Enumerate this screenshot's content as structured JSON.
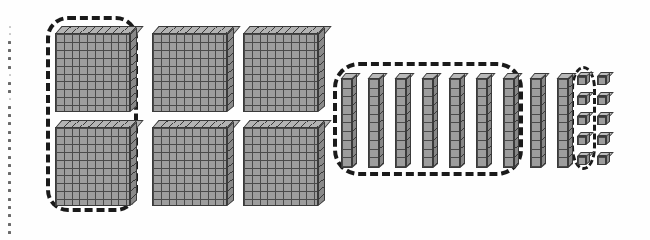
{
  "page": {
    "title": "Base-Ten Blocks Regrouping Worksheet",
    "background_color": "#fefefe",
    "width": 650,
    "height": 240
  },
  "perforation": {
    "name": "left-edge-dotted-perforation",
    "dot_count": 26,
    "color": "#6a6a6a"
  },
  "manipulatives": {
    "block_fill_color": "#9d9d9d",
    "block_line_color": "#3a3a3a",
    "group_ring_color": "#1a1a1a",
    "flats": {
      "label": "hundreds flats",
      "unit_value": 100,
      "count": 6,
      "columns": 3,
      "rows": 2,
      "cells_per_flat": 100,
      "grid": "10 by 10",
      "total_value": 600,
      "positions": [
        {
          "name": "flat-1",
          "x": 55,
          "y": 26,
          "circled": true
        },
        {
          "name": "flat-2",
          "x": 152,
          "y": 26,
          "circled": false
        },
        {
          "name": "flat-3",
          "x": 243,
          "y": 26,
          "circled": false
        },
        {
          "name": "flat-4",
          "x": 55,
          "y": 120,
          "circled": true
        },
        {
          "name": "flat-5",
          "x": 152,
          "y": 120,
          "circled": false
        },
        {
          "name": "flat-6",
          "x": 243,
          "y": 120,
          "circled": false
        }
      ]
    },
    "rods": {
      "label": "tens rods",
      "unit_value": 10,
      "count": 9,
      "cubes_per_rod": 10,
      "total_value": 90,
      "positions": [
        {
          "name": "rod-1",
          "x": 341,
          "y": 73,
          "circled": true
        },
        {
          "name": "rod-2",
          "x": 368,
          "y": 73,
          "circled": true
        },
        {
          "name": "rod-3",
          "x": 395,
          "y": 73,
          "circled": true
        },
        {
          "name": "rod-4",
          "x": 422,
          "y": 73,
          "circled": true
        },
        {
          "name": "rod-5",
          "x": 449,
          "y": 73,
          "circled": true
        },
        {
          "name": "rod-6",
          "x": 476,
          "y": 73,
          "circled": true
        },
        {
          "name": "rod-7",
          "x": 503,
          "y": 73,
          "circled": true
        },
        {
          "name": "rod-8",
          "x": 530,
          "y": 73,
          "circled": false
        },
        {
          "name": "rod-9",
          "x": 557,
          "y": 73,
          "circled": false
        }
      ]
    },
    "units": {
      "label": "ones unit cubes",
      "unit_value": 1,
      "count": 10,
      "columns": 2,
      "rows": 5,
      "total_value": 10,
      "positions": [
        {
          "name": "unit-1",
          "x": 577,
          "y": 72,
          "circled": true
        },
        {
          "name": "unit-2",
          "x": 597,
          "y": 72,
          "circled": false
        },
        {
          "name": "unit-3",
          "x": 577,
          "y": 92,
          "circled": true
        },
        {
          "name": "unit-4",
          "x": 597,
          "y": 92,
          "circled": false
        },
        {
          "name": "unit-5",
          "x": 577,
          "y": 112,
          "circled": true
        },
        {
          "name": "unit-6",
          "x": 597,
          "y": 112,
          "circled": false
        },
        {
          "name": "unit-7",
          "x": 577,
          "y": 132,
          "circled": true
        },
        {
          "name": "unit-8",
          "x": 597,
          "y": 132,
          "circled": false
        },
        {
          "name": "unit-9",
          "x": 577,
          "y": 152,
          "circled": true
        },
        {
          "name": "unit-10",
          "x": 597,
          "y": 152,
          "circled": false
        }
      ]
    }
  },
  "groupings": [
    {
      "name": "flats-group-ring",
      "shape": "rounded-rectangle",
      "encloses": "2 hundreds flats (left column)",
      "item_count": 2,
      "value": 200,
      "x": 46,
      "y": 16,
      "width": 92,
      "height": 196
    },
    {
      "name": "rods-group-ring",
      "shape": "rounded-rectangle",
      "encloses": "7 tens rods",
      "item_count": 7,
      "value": 70,
      "x": 333,
      "y": 62,
      "width": 190,
      "height": 114
    },
    {
      "name": "units-group-ring",
      "shape": "oval",
      "encloses": "5 ones unit cubes (left column)",
      "item_count": 5,
      "value": 5,
      "x": 571,
      "y": 66,
      "width": 25,
      "height": 104
    }
  ],
  "summary": {
    "hundreds": 6,
    "tens": 9,
    "ones": 10,
    "total_value": 700
  }
}
